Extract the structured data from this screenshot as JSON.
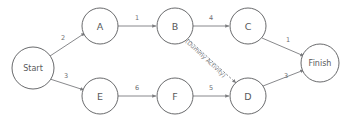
{
  "diagram": {
    "type": "project-network-diagram",
    "colors": {
      "background": "#ffffff",
      "node_stroke": "#58595b",
      "edge_stroke": "#7b7c7f",
      "text": "#58595b",
      "weight_text": "#6d6e71"
    },
    "nodes": [
      {
        "id": "start",
        "label": "Start",
        "cx": 33,
        "cy": 68,
        "r": 21,
        "font": "small"
      },
      {
        "id": "a",
        "label": "A",
        "cx": 100,
        "cy": 26,
        "r": 18,
        "font": "normal"
      },
      {
        "id": "b",
        "label": "B",
        "cx": 175,
        "cy": 26,
        "r": 18,
        "font": "normal"
      },
      {
        "id": "c",
        "label": "C",
        "cx": 248,
        "cy": 26,
        "r": 18,
        "font": "normal"
      },
      {
        "id": "e",
        "label": "E",
        "cx": 100,
        "cy": 96,
        "r": 18,
        "font": "normal"
      },
      {
        "id": "f",
        "label": "F",
        "cx": 175,
        "cy": 96,
        "r": 18,
        "font": "normal"
      },
      {
        "id": "d",
        "label": "D",
        "cx": 248,
        "cy": 96,
        "r": 18,
        "font": "normal"
      },
      {
        "id": "finish",
        "label": "Finish",
        "cx": 320,
        "cy": 63,
        "r": 19,
        "font": "small"
      }
    ],
    "edges": [
      {
        "id": "start-a",
        "from": "Start",
        "to": "A",
        "weight": "2",
        "style": "solid",
        "x1": 50,
        "y1": 56,
        "x2": 85,
        "y2": 33,
        "lx": 63,
        "ly": 38
      },
      {
        "id": "start-e",
        "from": "Start",
        "to": "E",
        "weight": "3",
        "style": "solid",
        "x1": 50,
        "y1": 79,
        "x2": 84,
        "y2": 90,
        "lx": 66,
        "ly": 76
      },
      {
        "id": "a-b",
        "from": "A",
        "to": "B",
        "weight": "1",
        "style": "solid",
        "x1": 118,
        "y1": 26,
        "x2": 156,
        "y2": 26,
        "lx": 137,
        "ly": 18
      },
      {
        "id": "b-c",
        "from": "B",
        "to": "C",
        "weight": "4",
        "style": "solid",
        "x1": 193,
        "y1": 26,
        "x2": 229,
        "y2": 26,
        "lx": 211,
        "ly": 18
      },
      {
        "id": "e-f",
        "from": "E",
        "to": "F",
        "weight": "6",
        "style": "solid",
        "x1": 118,
        "y1": 96,
        "x2": 156,
        "y2": 96,
        "lx": 137,
        "ly": 88
      },
      {
        "id": "f-d",
        "from": "F",
        "to": "D",
        "weight": "5",
        "style": "solid",
        "x1": 193,
        "y1": 96,
        "x2": 229,
        "y2": 96,
        "lx": 211,
        "ly": 88
      },
      {
        "id": "b-d",
        "from": "B",
        "to": "D",
        "weight": "",
        "style": "dashed",
        "x1": 188,
        "y1": 39,
        "x2": 236,
        "y2": 83,
        "lx": 0,
        "ly": 0
      },
      {
        "id": "c-finish",
        "from": "C",
        "to": "Finish",
        "weight": "1",
        "style": "solid",
        "x1": 262,
        "y1": 38,
        "x2": 304,
        "y2": 56,
        "lx": 288,
        "ly": 40
      },
      {
        "id": "d-finish",
        "from": "D",
        "to": "Finish",
        "weight": "3",
        "style": "solid",
        "x1": 263,
        "y1": 86,
        "x2": 304,
        "y2": 70,
        "lx": 286,
        "ly": 76
      }
    ],
    "annotations": [
      {
        "id": "dummy-activity",
        "text": "(Dummy Activity)",
        "x": 206,
        "y": 58,
        "rotate": 43
      }
    ]
  }
}
